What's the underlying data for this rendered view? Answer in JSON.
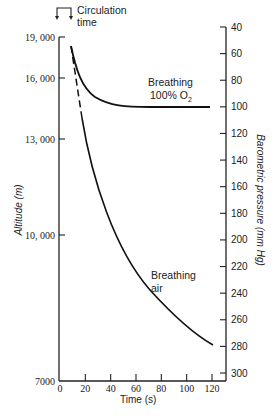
{
  "chart_data": {
    "type": "line",
    "title": "",
    "xlabel": "Time (s)",
    "ylabel": "Altitude (m)",
    "ylabel_right": "Barometric pressure (mm Hg)",
    "xlim": [
      0,
      120
    ],
    "x_ticks": [
      "0",
      "20",
      "40",
      "60",
      "80",
      "100",
      "120"
    ],
    "y_ticks_left": [
      "19, 000",
      "16, 000",
      "13, 000",
      "10, 000",
      "7000"
    ],
    "y_ticks_right": [
      "40",
      "60",
      "80",
      "100",
      "120",
      "140",
      "160",
      "180",
      "200",
      "220",
      "240",
      "260",
      "280",
      "300"
    ],
    "ylim_right_mmHg": [
      40,
      300
    ],
    "grid": false,
    "annotations": [
      {
        "text": "Circulation time",
        "note": "bracket with two downward arrows spanning ~0 to ~8 s at top"
      },
      {
        "text": "Breathing 100% O2",
        "near_series": "Breathing 100% O2"
      },
      {
        "text": "Breathing air",
        "near_series": "Breathing air"
      }
    ],
    "series": [
      {
        "name": "Breathing 100% O2",
        "style": "solid",
        "x": [
          8,
          10,
          15,
          20,
          30,
          40,
          50,
          60,
          80,
          100,
          118
        ],
        "y_mmHg": [
          54,
          60,
          77,
          86,
          95,
          99,
          100,
          101,
          101,
          101,
          101
        ]
      },
      {
        "name": "Breathing air",
        "style": "dashed 8-20 s, solid after",
        "x": [
          8,
          12,
          16,
          20,
          30,
          40,
          50,
          60,
          70,
          80,
          90,
          100,
          110,
          118
        ],
        "y_mmHg": [
          54,
          80,
          110,
          135,
          170,
          196,
          217,
          233,
          246,
          257,
          265,
          272,
          278,
          282
        ]
      }
    ]
  },
  "labels": {
    "circulation_line1": "Circulation",
    "circulation_line2": "time",
    "o2_line1": "Breathing",
    "o2_line2": "100% O",
    "o2_sub": "2",
    "air_line1": "Breathing",
    "air_line2": "air",
    "xlabel": "Time (s)",
    "ylabel_left": "Altitude (m)",
    "ylabel_right": "Barometric pressure (mm Hg)"
  }
}
